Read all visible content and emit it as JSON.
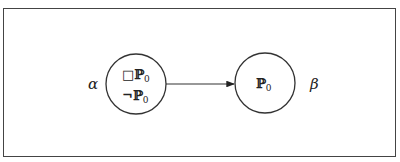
{
  "diagram": {
    "nodes": [
      {
        "id": "alpha",
        "label": "α",
        "contents": [
          "□ℙ₀",
          "¬ℙ₀"
        ],
        "content_parts": [
          {
            "prefix": "□",
            "var": "ℙ",
            "sub": "0"
          },
          {
            "prefix": "¬",
            "var": "ℙ",
            "sub": "0"
          }
        ]
      },
      {
        "id": "beta",
        "label": "β",
        "contents": [
          "ℙ₀"
        ],
        "content_parts": [
          {
            "prefix": "",
            "var": "ℙ",
            "sub": "0"
          }
        ]
      }
    ],
    "edges": [
      {
        "from": "alpha",
        "to": "beta",
        "directed": true
      }
    ],
    "colors": {
      "stroke": "#333333",
      "background": "#ffffff"
    }
  }
}
